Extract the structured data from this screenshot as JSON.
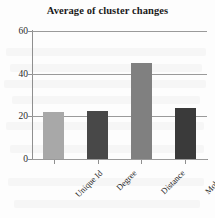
{
  "chart_data": {
    "type": "bar",
    "title": "Average of cluster changes",
    "xlabel": "",
    "ylabel": "",
    "categories": [
      "Unique Id",
      "Degree",
      "Distance",
      "Mobility"
    ],
    "values": [
      22,
      22.5,
      45,
      24
    ],
    "ylim": [
      0,
      60
    ],
    "yticks": [
      0,
      20,
      40,
      60
    ],
    "ytick_labels": [
      "0",
      "20",
      "40",
      "60"
    ],
    "grid": true,
    "legend": false,
    "legend_position": "none",
    "bar_colors": [
      "#a8a8a8",
      "#484848",
      "#808080",
      "#3a3a3a"
    ],
    "axis_color": "#8f8f8f",
    "gridline_color": "#9a9a9a",
    "category_label_rotation": -45,
    "background": "#fdfdfd"
  }
}
